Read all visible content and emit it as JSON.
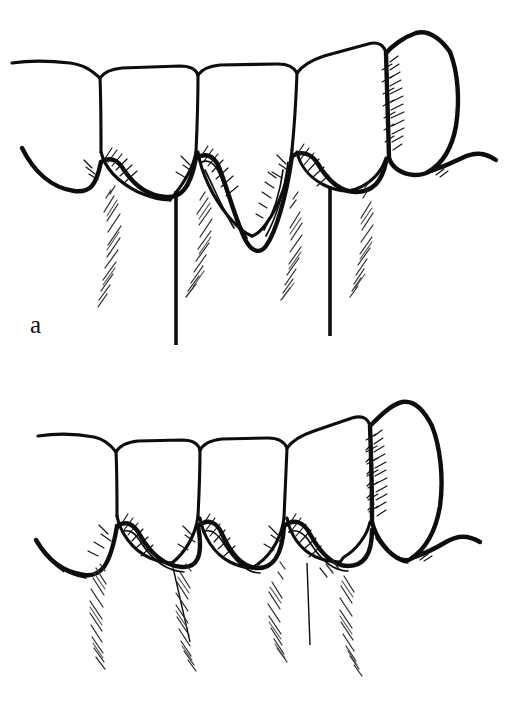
{
  "figure": {
    "type": "line-drawing",
    "background_color": "#ffffff",
    "ink_color": "#0d0d0d",
    "width": 507,
    "height": 714,
    "panels": [
      {
        "id": "a",
        "label": "a",
        "caption_position": "bottom-left",
        "description": "Teeth with deep periodontal pocket and two long periodontal probes inserted",
        "tooth_count": 5,
        "probe_count": 2,
        "probe_length": "long",
        "pocket_depth": "deep",
        "gingival_margin": "receded"
      },
      {
        "id": "b",
        "label": "b",
        "caption_position": "bottom-left",
        "description": "Teeth with shallow sulcus and two short probes inserted",
        "tooth_count": 5,
        "probe_count": 2,
        "probe_length": "short",
        "pocket_depth": "shallow",
        "gingival_margin": "normal"
      }
    ]
  }
}
